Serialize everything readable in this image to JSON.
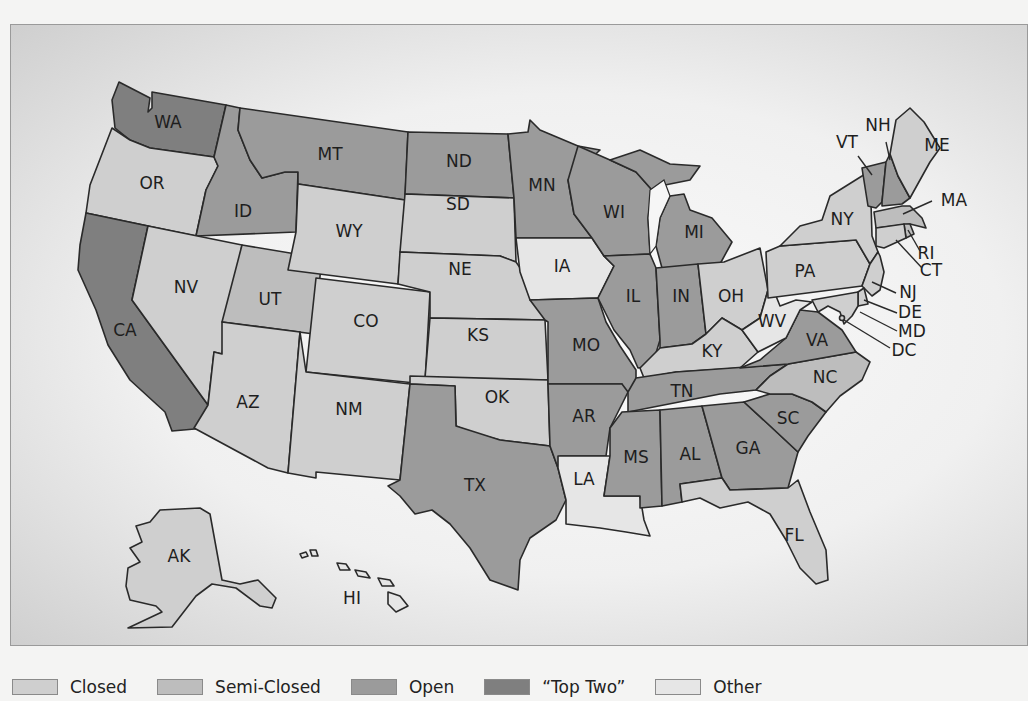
{
  "map": {
    "subject": "United States primary election types by state",
    "colors": {
      "closed": "#cfcfcf",
      "semi_closed": "#bdbdbd",
      "open": "#9b9b9b",
      "top_two": "#7f7f7f",
      "other": "#e6e6e6"
    },
    "states": {
      "WA": {
        "label": "WA",
        "type": "top_two"
      },
      "OR": {
        "label": "OR",
        "type": "closed"
      },
      "CA": {
        "label": "CA",
        "type": "top_two"
      },
      "ID": {
        "label": "ID",
        "type": "open"
      },
      "NV": {
        "label": "NV",
        "type": "closed"
      },
      "MT": {
        "label": "MT",
        "type": "open"
      },
      "WY": {
        "label": "WY",
        "type": "closed"
      },
      "UT": {
        "label": "UT",
        "type": "semi_closed"
      },
      "AZ": {
        "label": "AZ",
        "type": "closed"
      },
      "CO": {
        "label": "CO",
        "type": "closed"
      },
      "NM": {
        "label": "NM",
        "type": "closed"
      },
      "ND": {
        "label": "ND",
        "type": "open"
      },
      "SD": {
        "label": "SD",
        "type": "closed"
      },
      "NE": {
        "label": "NE",
        "type": "closed"
      },
      "KS": {
        "label": "KS",
        "type": "closed"
      },
      "OK": {
        "label": "OK",
        "type": "closed"
      },
      "TX": {
        "label": "TX",
        "type": "open"
      },
      "MN": {
        "label": "MN",
        "type": "open"
      },
      "IA": {
        "label": "IA",
        "type": "other"
      },
      "MO": {
        "label": "MO",
        "type": "open"
      },
      "AR": {
        "label": "AR",
        "type": "open"
      },
      "LA": {
        "label": "LA",
        "type": "other"
      },
      "WI": {
        "label": "WI",
        "type": "open"
      },
      "IL": {
        "label": "IL",
        "type": "open"
      },
      "MI": {
        "label": "MI",
        "type": "open"
      },
      "IN": {
        "label": "IN",
        "type": "open"
      },
      "OH": {
        "label": "OH",
        "type": "closed"
      },
      "KY": {
        "label": "KY",
        "type": "closed"
      },
      "TN": {
        "label": "TN",
        "type": "open"
      },
      "MS": {
        "label": "MS",
        "type": "open"
      },
      "AL": {
        "label": "AL",
        "type": "open"
      },
      "GA": {
        "label": "GA",
        "type": "open"
      },
      "FL": {
        "label": "FL",
        "type": "closed"
      },
      "SC": {
        "label": "SC",
        "type": "open"
      },
      "NC": {
        "label": "NC",
        "type": "semi_closed"
      },
      "VA": {
        "label": "VA",
        "type": "open"
      },
      "WV": {
        "label": "WV",
        "type": "other"
      },
      "PA": {
        "label": "PA",
        "type": "closed"
      },
      "NY": {
        "label": "NY",
        "type": "closed"
      },
      "VT": {
        "label": "VT",
        "type": "open"
      },
      "NH": {
        "label": "NH",
        "type": "open"
      },
      "ME": {
        "label": "ME",
        "type": "closed"
      },
      "MA": {
        "label": "MA",
        "type": "semi_closed"
      },
      "RI": {
        "label": "RI",
        "type": "semi_closed"
      },
      "CT": {
        "label": "CT",
        "type": "closed"
      },
      "NJ": {
        "label": "NJ",
        "type": "closed"
      },
      "DE": {
        "label": "DE",
        "type": "closed"
      },
      "MD": {
        "label": "MD",
        "type": "closed"
      },
      "DC": {
        "label": "DC",
        "type": "closed"
      },
      "AK": {
        "label": "AK",
        "type": "closed"
      },
      "HI": {
        "label": "HI",
        "type": "other"
      }
    }
  },
  "legend": {
    "items": [
      {
        "key": "closed",
        "label": "Closed"
      },
      {
        "key": "semi_closed",
        "label": "Semi-Closed"
      },
      {
        "key": "open",
        "label": "Open"
      },
      {
        "key": "top_two",
        "label": "“Top Two”"
      },
      {
        "key": "other",
        "label": "Other"
      }
    ]
  }
}
